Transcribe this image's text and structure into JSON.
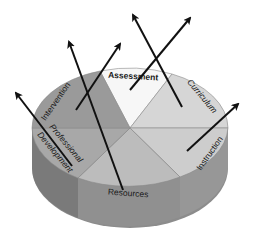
{
  "diagram": {
    "type": "3d-pie-with-outward-arrows",
    "segments": [
      {
        "id": "assessment",
        "label": "Assessment",
        "color": "#f7f7f7"
      },
      {
        "id": "curriculum",
        "label": "Curriculum",
        "color": "#d4d4d4"
      },
      {
        "id": "instruction",
        "label": "Instruction",
        "color": "#cfcfcf"
      },
      {
        "id": "resources",
        "label": "Resources",
        "color": "#bdbdbd"
      },
      {
        "id": "professional-development",
        "label_line1": "Professional",
        "label_line2": "Development",
        "color": "#a9a9a9"
      },
      {
        "id": "intervention",
        "label": "Intervention",
        "color": "#9a9a9a"
      }
    ],
    "side_colors": {
      "left": "#7e7e7e",
      "front": "#8f8f8f",
      "right": "#959595"
    },
    "arrow_color": "#111111",
    "arrow_count": 6
  }
}
